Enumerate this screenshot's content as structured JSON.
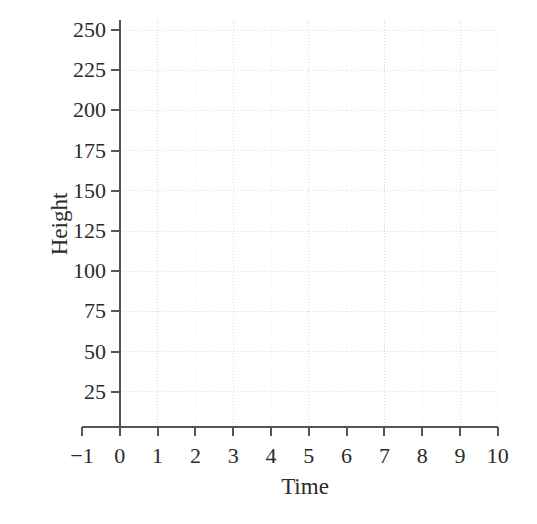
{
  "chart_data": {
    "type": "line",
    "title": "",
    "subtitle": "",
    "xlabel": "Time",
    "ylabel": "Height",
    "xlim": [
      -1,
      10
    ],
    "ylim": [
      0,
      250
    ],
    "x_ticks": [
      "−1",
      "0",
      "1",
      "2",
      "3",
      "4",
      "5",
      "6",
      "7",
      "8",
      "9",
      "10"
    ],
    "x_tick_values": [
      -1,
      0,
      1,
      2,
      3,
      4,
      5,
      6,
      7,
      8,
      9,
      10
    ],
    "y_ticks": [
      "250",
      "225",
      "200",
      "175",
      "150",
      "125",
      "100",
      "75",
      "50",
      "25"
    ],
    "y_tick_values": [
      250,
      225,
      200,
      175,
      150,
      125,
      100,
      75,
      50,
      25
    ],
    "grid": true,
    "grid_major_x_values": [
      1,
      3,
      5,
      7,
      9
    ],
    "grid_minor_x_values": [
      0,
      2,
      4,
      6,
      8,
      10
    ],
    "grid_y_values": [
      25,
      50,
      75,
      100,
      125,
      150,
      175,
      200,
      225,
      250
    ],
    "legend": null,
    "series": [],
    "annotations": [],
    "note": "empty grid — axes drawn, no data plotted"
  },
  "axes": {
    "x_title": "Time",
    "y_title": "Height"
  },
  "colors": {
    "axis": "#555555",
    "grid_major": "#d8d8d8",
    "grid_minor": "#ededed",
    "text": "#2b2b2b",
    "background": "#ffffff"
  },
  "geometry": {
    "plot_left": 120,
    "plot_right": 498,
    "plot_top": 20,
    "plot_bottom": 427,
    "x_min_px": 82,
    "px_per_x_unit": 37.8,
    "px_per_y_25": 40.2
  }
}
